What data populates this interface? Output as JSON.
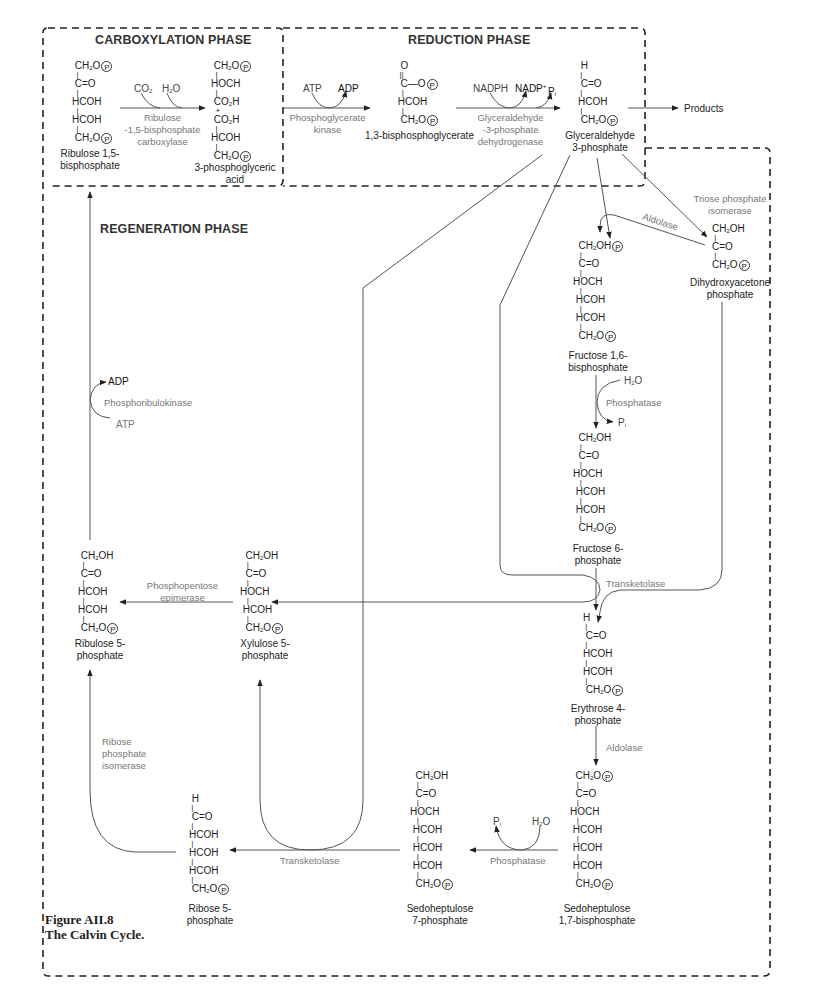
{
  "figure": {
    "caption_line1": "Figure AII.8",
    "caption_line2": "The Calvin Cycle."
  },
  "phases": {
    "carboxylation": "CARBOXYLATION PHASE",
    "reduction": "REDUCTION PHASE",
    "regeneration": "REGENERATION PHASE"
  },
  "molecules": {
    "rubp": {
      "name1": "Ribulose 1,5-",
      "name2": "bisphosphate"
    },
    "pga": {
      "name1": "3-phosphoglyceric",
      "name2": "acid"
    },
    "bpg": {
      "name1": "1,3-bisphosphoglycerate"
    },
    "g3p": {
      "name1": "Glyceraldehyde",
      "name2": "3-phosphate"
    },
    "dhap": {
      "name1": "Dihydroxyacetone",
      "name2": "phosphate"
    },
    "fbp": {
      "name1": "Fructose 1,6-",
      "name2": "bisphosphate"
    },
    "f6p": {
      "name1": "Fructose 6-",
      "name2": "phosphate"
    },
    "e4p": {
      "name1": "Erythrose 4-",
      "name2": "phosphate"
    },
    "sbp": {
      "name1": "Sedoheptulose",
      "name2": "1,7-bisphosphate"
    },
    "s7p": {
      "name1": "Sedoheptulose",
      "name2": "7-phosphate"
    },
    "r5p": {
      "name1": "Ribose 5-",
      "name2": "phosphate"
    },
    "xu5p": {
      "name1": "Xylulose 5-",
      "name2": "phosphate"
    },
    "ru5p": {
      "name1": "Ribulose 5-",
      "name2": "phosphate"
    }
  },
  "enzymes": {
    "rubisco": [
      "Ribulose",
      "-1,5-bisphosphate",
      "carboxylase"
    ],
    "pgk": [
      "Phosphoglycerate",
      "kinase"
    ],
    "gapdh": [
      "Glyceraldehyde",
      "-3-phosphate",
      "dehydrogenase"
    ],
    "tpi": [
      "Triose phosphate",
      "isomerase"
    ],
    "aldolase1": "Aldolase",
    "fbpase": "Phosphatase",
    "transketolase1": "Transketolase",
    "aldolase2": "Aldolase",
    "sbpase": "Phosphatase",
    "transketolase2": "Transketolase",
    "epimerase": [
      "Phosphopentose",
      "epimerase"
    ],
    "rpi": [
      "Ribose",
      "phosphate",
      "isomerase"
    ],
    "prk": "Phosphoribulokinase"
  },
  "cofactors": {
    "co2": "CO2",
    "h2o_1": "H2O",
    "atp_1": "ATP",
    "adp_1": "ADP",
    "nadph": "NADPH",
    "nadp": "NADP+",
    "pi_1": "Pi",
    "h2o_2": "H2O",
    "pi_2": "Pi",
    "pi_3": "Pi",
    "h2o_3": "H2O",
    "adp_2": "ADP",
    "atp_2": "ATP"
  },
  "output": {
    "products": "Products"
  },
  "colors": {
    "line": "#333333",
    "enzyme_text": "#777777",
    "dashed_border": "#222222"
  }
}
